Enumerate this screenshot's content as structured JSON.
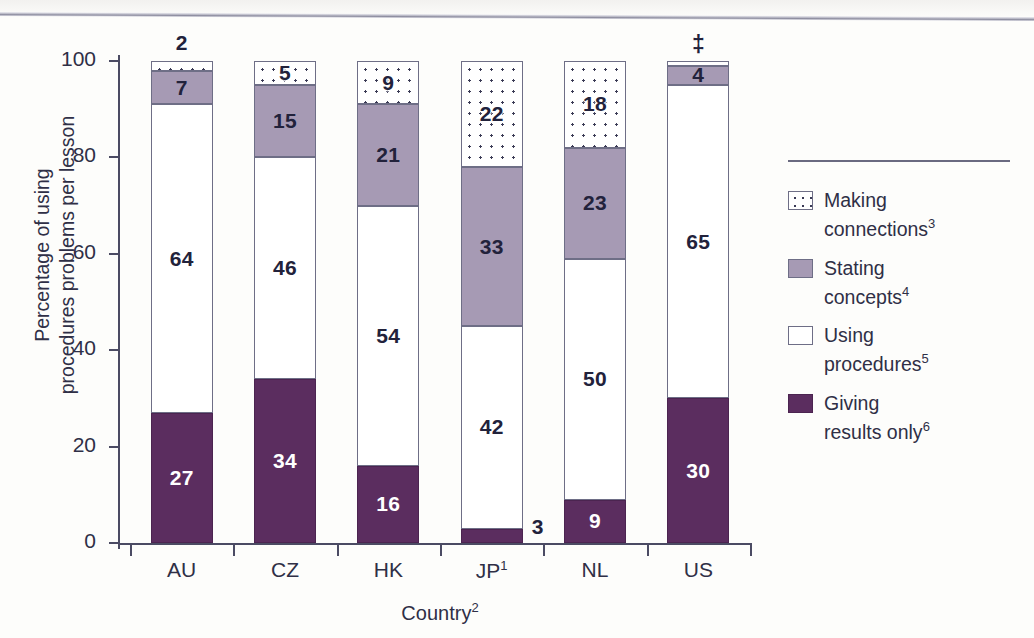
{
  "chart_data": {
    "type": "bar",
    "subtype": "stacked-bar-100",
    "title": "",
    "xlabel": "Country",
    "xlabel_sup": "2",
    "ylabel": "Percentage of using procedures problems per lesson",
    "ylabel_line1": "Percentage of using",
    "ylabel_line2": "procedures problems per lesson",
    "ylim": [
      0,
      100
    ],
    "yticks": [
      0,
      20,
      40,
      60,
      80,
      100
    ],
    "grid": false,
    "legend_position": "right",
    "categories": [
      "AU",
      "CZ",
      "HK",
      "JP",
      "NL",
      "US"
    ],
    "category_labels": [
      "AU",
      "CZ",
      "HK",
      "JP¹",
      "NL",
      "US"
    ],
    "category_sup": [
      "",
      "",
      "",
      "1",
      "",
      ""
    ],
    "series": [
      {
        "name": "Giving results only",
        "name_sup": "6",
        "color": "#5b2d5f",
        "pattern": "solid",
        "values": [
          27,
          34,
          16,
          3,
          9,
          30
        ],
        "labels": [
          "27",
          "34",
          "16",
          "3",
          "9",
          "30"
        ]
      },
      {
        "name": "Using procedures",
        "name_sup": "5",
        "color": "#ffffff",
        "pattern": "solid",
        "values": [
          64,
          46,
          54,
          42,
          50,
          65
        ],
        "labels": [
          "64",
          "46",
          "54",
          "42",
          "50",
          "65"
        ]
      },
      {
        "name": "Stating concepts",
        "name_sup": "4",
        "color": "#a69ab4",
        "pattern": "solid",
        "values": [
          7,
          15,
          21,
          33,
          23,
          4
        ],
        "labels": [
          "7",
          "15",
          "21",
          "33",
          "23",
          "4"
        ]
      },
      {
        "name": "Making connections",
        "name_sup": "3",
        "color": "#ffffff",
        "pattern": "dotted",
        "values": [
          2,
          5,
          9,
          22,
          18,
          1
        ],
        "labels": [
          "2",
          "5",
          "9",
          "22",
          "18",
          "‡"
        ]
      }
    ],
    "annotations": [
      {
        "text": "2",
        "category": "AU",
        "placement": "above-bar",
        "note": "Making connections value too small to label inside"
      },
      {
        "text": "3",
        "category": "JP",
        "placement": "right-of-segment",
        "note": "Giving results only value too small to label inside"
      },
      {
        "text": "‡",
        "category": "US",
        "placement": "above-bar",
        "note": "Reporting standards not met for Making connections"
      }
    ]
  },
  "legend": {
    "items": [
      {
        "swatch": "making-connections-swatch",
        "line1": "Making",
        "line2": "connections",
        "sup": "3"
      },
      {
        "swatch": "stating-concepts-swatch",
        "line1": "Stating",
        "line2": "concepts",
        "sup": "4"
      },
      {
        "swatch": "using-procedures-swatch",
        "line1": "Using",
        "line2": "procedures",
        "sup": "5"
      },
      {
        "swatch": "giving-results-swatch",
        "line1": "Giving",
        "line2": "results only",
        "sup": "6"
      }
    ]
  },
  "axis": {
    "y_tick_labels": [
      "100",
      "80",
      "60",
      "40",
      "20",
      "0"
    ],
    "x_tick_labels": [
      "AU",
      "CZ",
      "HK",
      "JP",
      "NL",
      "US"
    ],
    "x_title_main": "Country",
    "x_title_sup": "2",
    "y_title_line1": "Percentage of using",
    "y_title_line2": "procedures problems per lesson"
  }
}
